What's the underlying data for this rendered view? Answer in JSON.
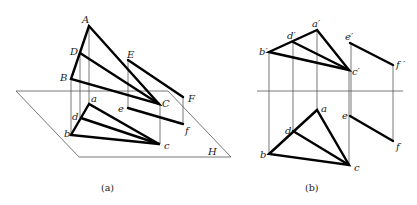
{
  "figure_a": {
    "caption": "(a)",
    "plane_label": "H",
    "space_points": {
      "A": "A",
      "B": "B",
      "C": "C",
      "D": "D",
      "E": "E",
      "F": "F"
    },
    "projection_points": {
      "a": "a",
      "b": "b",
      "c": "c",
      "d": "d",
      "e": "e",
      "f": "f"
    }
  },
  "figure_b": {
    "caption": "(b)",
    "front_view_points": {
      "a": "a′",
      "b": "b′",
      "c": "c′",
      "d": "d′",
      "e": "e′",
      "f": "f ′"
    },
    "top_view_points": {
      "a": "a",
      "b": "b",
      "c": "c",
      "d": "d",
      "e": "e",
      "f": "f"
    }
  }
}
